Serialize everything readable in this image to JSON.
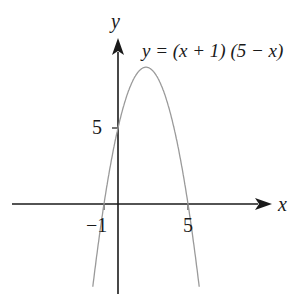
{
  "chart_data": {
    "type": "line",
    "title": "",
    "equation_label": "y = (x + 1) (5 − x)",
    "xlabel": "x",
    "ylabel": "y",
    "x_ticks": [
      {
        "value": -1,
        "label": "−1"
      },
      {
        "value": 5,
        "label": "5"
      }
    ],
    "y_ticks": [
      {
        "value": 5,
        "label": "5"
      }
    ],
    "series": [
      {
        "name": "y = (x + 1)(5 − x)",
        "function": "(x+1)*(5-x)",
        "x": [
          -1.8,
          -1,
          0,
          1,
          2,
          3,
          4,
          5,
          5.8
        ],
        "y": [
          -6.24,
          0,
          5,
          8,
          9,
          8,
          5,
          0,
          -6.24
        ]
      }
    ],
    "key_points": {
      "roots": [
        -1,
        5
      ],
      "y_intercept": 5,
      "vertex": [
        2,
        9
      ]
    },
    "grid": false,
    "curve_color": "#9a9a9a",
    "axis_color": "#1a1a1a"
  },
  "labels": {
    "y_axis": "y",
    "x_axis": "x",
    "equation": "y = (x + 1) (5 − x)",
    "tick_neg1": "−1",
    "tick_5x": "5",
    "tick_5y": "5"
  }
}
